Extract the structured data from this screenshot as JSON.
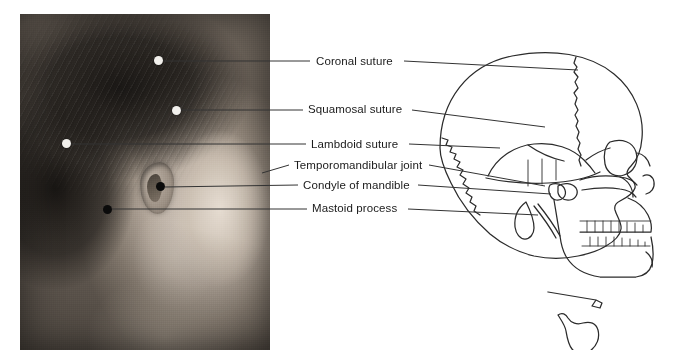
{
  "figure": {
    "type": "anatomy-figure",
    "background_color": "#ffffff",
    "text_color": "#1a1a1a",
    "line_color": "#3a3a3a"
  },
  "photo": {
    "name": "lateral-head-photograph",
    "style": "black-and-white",
    "x": 20,
    "y": 14,
    "width": 250,
    "height": 336,
    "markers": [
      {
        "id": "coronal-suture-marker",
        "x": 158,
        "y": 60,
        "tone": "light"
      },
      {
        "id": "squamosal-suture-marker",
        "x": 176,
        "y": 110,
        "tone": "light"
      },
      {
        "id": "lambdoid-suture-marker",
        "x": 66,
        "y": 143,
        "tone": "light"
      },
      {
        "id": "condyle-of-mandible-marker",
        "x": 160,
        "y": 186,
        "tone": "dark"
      },
      {
        "id": "mastoid-process-marker",
        "x": 107,
        "y": 209,
        "tone": "dark"
      }
    ]
  },
  "labels": [
    {
      "id": "coronal-suture",
      "text": "Coronal suture",
      "text_x": 316,
      "text_y": 56,
      "left_line": {
        "x1": 163,
        "y1": 61,
        "x2": 310,
        "y2": 61
      },
      "right_line": {
        "x1": 404,
        "y1": 61,
        "x2": 578,
        "y2": 70
      }
    },
    {
      "id": "squamosal-suture",
      "text": "Squamosal suture",
      "text_x": 308,
      "text_y": 104,
      "left_line": {
        "x1": 181,
        "y1": 110,
        "x2": 303,
        "y2": 110
      },
      "right_line": {
        "x1": 412,
        "y1": 110,
        "x2": 545,
        "y2": 127
      }
    },
    {
      "id": "lambdoid-suture",
      "text": "Lambdoid suture",
      "text_x": 311,
      "text_y": 140,
      "left_line": {
        "x1": 71,
        "y1": 144,
        "x2": 306,
        "y2": 144
      },
      "right_line": {
        "x1": 409,
        "y1": 144,
        "x2": 500,
        "y2": 148
      }
    },
    {
      "id": "temporomandibular-joint",
      "text": "Temporomandibular joint",
      "text_x": 294,
      "text_y": 161,
      "left_line": {
        "x1": 262,
        "y1": 172,
        "x2": 289,
        "y2": 165
      },
      "right_line": {
        "x1": 429,
        "y1": 165,
        "x2": 545,
        "y2": 186
      }
    },
    {
      "id": "condyle-of-mandible",
      "text": "Condyle of mandible",
      "text_x": 303,
      "text_y": 181,
      "left_line": {
        "x1": 165,
        "y1": 187,
        "x2": 298,
        "y2": 185
      },
      "right_line": {
        "x1": 418,
        "y1": 185,
        "x2": 551,
        "y2": 194
      }
    },
    {
      "id": "mastoid-process",
      "text": "Mastoid process",
      "text_x": 312,
      "text_y": 204,
      "left_line": {
        "x1": 112,
        "y1": 209,
        "x2": 307,
        "y2": 209
      },
      "right_line": {
        "x1": 408,
        "y1": 209,
        "x2": 538,
        "y2": 215
      }
    }
  ],
  "skull": {
    "name": "lateral-skull-diagram",
    "x": 430,
    "y": 20,
    "width": 240,
    "height": 330,
    "parts": [
      "cranial-vault",
      "frontal-bone",
      "parietal-bone",
      "temporal-bone",
      "occipital-bone",
      "coronal-suture",
      "squamosal-suture",
      "lambdoid-suture",
      "orbit",
      "nasal-aperture",
      "zygomatic-arch",
      "maxilla-with-teeth",
      "mandible-with-teeth",
      "mandibular-condyle",
      "mastoid-process",
      "styloid-process",
      "hyoid-bone"
    ]
  }
}
